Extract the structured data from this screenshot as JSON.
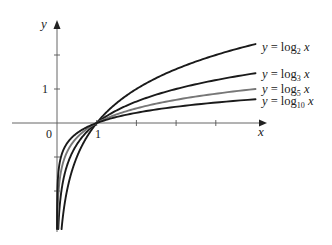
{
  "chart_data": {
    "type": "line",
    "title": "",
    "xlabel": "x",
    "ylabel": "y",
    "xlim": [
      0,
      5
    ],
    "ylim": [
      -3.12,
      2.9
    ],
    "grid": false,
    "legend_position": "inline-right",
    "x_tick_labels": [
      {
        "value": 0,
        "label": "0"
      },
      {
        "value": 1,
        "label": "1"
      },
      {
        "value": 2,
        "label": ""
      },
      {
        "value": 3,
        "label": ""
      },
      {
        "value": 4,
        "label": ""
      }
    ],
    "y_tick_labels": [
      {
        "value": 2,
        "label": ""
      },
      {
        "value": 1,
        "label": "1"
      },
      {
        "value": -1,
        "label": ""
      },
      {
        "value": -2,
        "label": ""
      }
    ],
    "series": [
      {
        "name": "y = log2 x",
        "base": 2,
        "color": "#1a1a1a",
        "label_main": "y = log",
        "label_sub": "2",
        "label_tail": " x",
        "x": [
          0.115,
          0.25,
          0.5,
          1,
          2,
          3,
          4,
          5
        ],
        "values": [
          -3.12,
          -2,
          -1,
          0,
          1,
          1.58,
          2,
          2.32
        ]
      },
      {
        "name": "y = log3 x",
        "base": 3,
        "color": "#1a1a1a",
        "label_main": "y = log",
        "label_sub": "3",
        "label_tail": " x",
        "x": [
          0.032,
          0.111,
          0.333,
          1,
          2,
          3,
          4,
          5
        ],
        "values": [
          -3.12,
          -2,
          -1,
          0,
          0.63,
          1,
          1.26,
          1.46
        ]
      },
      {
        "name": "y = log5 x",
        "base": 5,
        "color": "#777777",
        "label_main": "y = log",
        "label_sub": "5",
        "label_tail": " x",
        "x": [
          0.0066,
          0.04,
          0.2,
          1,
          2,
          3,
          4,
          5
        ],
        "values": [
          -3.12,
          -2,
          -1,
          0,
          0.43,
          0.68,
          0.86,
          1
        ]
      },
      {
        "name": "y = log10 x",
        "base": 10,
        "color": "#1a1a1a",
        "label_main": "y = log",
        "label_sub": "10",
        "label_tail": " x",
        "x": [
          0.00076,
          0.01,
          0.1,
          1,
          2,
          3,
          4,
          5
        ],
        "values": [
          -3.12,
          -2,
          -1,
          0,
          0.3,
          0.48,
          0.6,
          0.7
        ]
      }
    ],
    "annotations": [
      "All curves pass through (1, 0)"
    ]
  },
  "axes": {
    "x_label": "x",
    "y_label": "y",
    "origin_label": "0",
    "x_one_label": "1",
    "y_one_label": "1"
  }
}
